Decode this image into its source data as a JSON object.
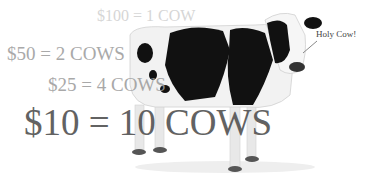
{
  "lines": {
    "hundred": "$100 = 1 COW",
    "fifty": "$50 = 2 COWS",
    "twentyfive": "$25 = 4 COWS",
    "ten": "$10 = 10 COWS"
  },
  "callout": "Holy Cow!",
  "image": {
    "subject": "holstein-cow"
  }
}
